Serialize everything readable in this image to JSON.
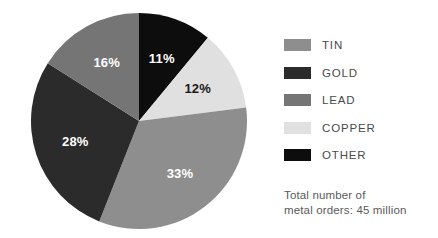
{
  "chart_data": {
    "type": "pie",
    "title": "",
    "labels": [
      "OTHER",
      "COPPER",
      "TIN",
      "GOLD",
      "LEAD"
    ],
    "values": [
      11,
      12,
      33,
      28,
      16
    ],
    "value_labels": [
      "11%",
      "12%",
      "33%",
      "28%",
      "16%"
    ],
    "colors": [
      "#0d0d0d",
      "#e0e0e0",
      "#8e8e8e",
      "#2b2b2b",
      "#757575"
    ],
    "units": "percent",
    "start_angle_deg": 0,
    "direction": "clockwise",
    "legend_position": "right",
    "grid": false,
    "annotation": "Total number of metal orders: 45 million",
    "slices": [
      {
        "label": "OTHER",
        "value": 11,
        "display": "11%",
        "color": "#0d0d0d",
        "label_color": "on-dark"
      },
      {
        "label": "COPPER",
        "value": 12,
        "display": "12%",
        "color": "#e0e0e0",
        "label_color": "on-light"
      },
      {
        "label": "TIN",
        "value": 33,
        "display": "33%",
        "color": "#8e8e8e",
        "label_color": "on-dark"
      },
      {
        "label": "GOLD",
        "value": 28,
        "display": "28%",
        "color": "#2b2b2b",
        "label_color": "on-dark"
      },
      {
        "label": "LEAD",
        "value": 16,
        "display": "16%",
        "color": "#757575",
        "label_color": "on-dark"
      }
    ]
  },
  "legend": {
    "items": [
      {
        "label": "TIN",
        "color": "#8e8e8e"
      },
      {
        "label": "GOLD",
        "color": "#2b2b2b"
      },
      {
        "label": "LEAD",
        "color": "#757575"
      },
      {
        "label": "COPPER",
        "color": "#e0e0e0"
      },
      {
        "label": "OTHER",
        "color": "#0d0d0d"
      }
    ]
  },
  "footnote": {
    "line1": "Total number of",
    "line2": "metal orders: 45 million"
  }
}
